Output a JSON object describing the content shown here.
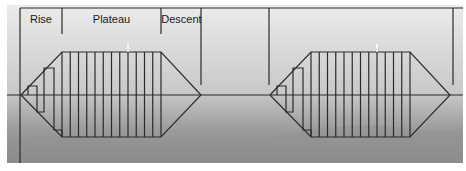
{
  "diagram": {
    "phases": [
      {
        "label": "Rise",
        "x0": 20,
        "x1": 62
      },
      {
        "label": "Plateau",
        "x0": 62,
        "x1": 161
      },
      {
        "label": "Descent",
        "x0": 161,
        "x1": 201
      }
    ],
    "colors": {
      "line": "#2a2a2a",
      "bg_top": "#ebebeb",
      "bg_mid": "#c9c9c9",
      "bg_bottom": "#8a8a8a",
      "marker": "#ffffff"
    },
    "baseline_y": 95,
    "waveforms": [
      {
        "offset_x": 0
      },
      {
        "offset_x": 249
      }
    ],
    "plateau_pulse_count": 13
  }
}
